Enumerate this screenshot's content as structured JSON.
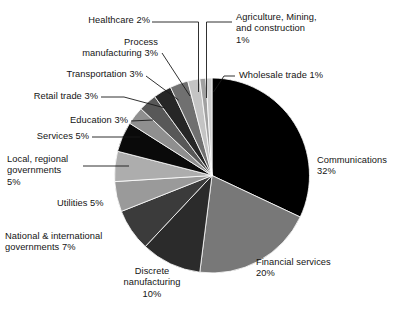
{
  "chart_data": {
    "type": "pie",
    "title": "",
    "subtitle": "",
    "xlabel": "",
    "ylabel": "",
    "legend_position": "callout-labels",
    "grid": false,
    "start_angle_deg": 0,
    "direction": "clockwise",
    "units": "percent",
    "categories": [
      "Communications",
      "Financial services",
      "Discrete nanufacturing",
      "National & international governments",
      "Utilities",
      "Local, regional governments",
      "Services",
      "Education",
      "Retail trade",
      "Transportation",
      "Process manufacturing",
      "Healthcare",
      "Agriculture, Mining, and construction",
      "Wholesale trade"
    ],
    "values": [
      32,
      20,
      10,
      7,
      5,
      5,
      5,
      3,
      3,
      3,
      3,
      2,
      1,
      1
    ],
    "slice_colors": [
      "#000000",
      "#787878",
      "#2b2b2b",
      "#3b3b3b",
      "#9a9a9a",
      "#adadad",
      "#0a0a0a",
      "#8f8f8f",
      "#585858",
      "#262626",
      "#707070",
      "#c4c4c4",
      "#a0a0a0",
      "#cfcfcf"
    ],
    "slices": [
      {
        "label": "Communications",
        "value": 32,
        "display": "Communications\n32%",
        "color": "#000000"
      },
      {
        "label": "Financial services",
        "value": 20,
        "display": "Financial services\n20%",
        "color": "#787878"
      },
      {
        "label": "Discrete nanufacturing",
        "value": 10,
        "display": "Discrete\nnanufacturing\n10%",
        "color": "#2b2b2b"
      },
      {
        "label": "National & international governments",
        "value": 7,
        "display": "National & international\ngovernments 7%",
        "color": "#3b3b3b"
      },
      {
        "label": "Utilities",
        "value": 5,
        "display": "Utilities 5%",
        "color": "#9a9a9a"
      },
      {
        "label": "Local, regional governments",
        "value": 5,
        "display": "Local, regional\ngovernments\n5%",
        "color": "#adadad"
      },
      {
        "label": "Services",
        "value": 5,
        "display": "Services 5%",
        "color": "#0a0a0a"
      },
      {
        "label": "Education",
        "value": 3,
        "display": "Education 3%",
        "color": "#8f8f8f"
      },
      {
        "label": "Retail trade",
        "value": 3,
        "display": "Retail trade 3%",
        "color": "#585858"
      },
      {
        "label": "Transportation",
        "value": 3,
        "display": "Transportation 3%",
        "color": "#262626"
      },
      {
        "label": "Process manufacturing",
        "value": 3,
        "display": "Process\nmanufacturing 3%",
        "color": "#707070"
      },
      {
        "label": "Healthcare",
        "value": 2,
        "display": "Healthcare 2%",
        "color": "#c4c4c4"
      },
      {
        "label": "Agriculture, Mining, and construction",
        "value": 1,
        "display": "Agriculture, Mining,\nand construction\n1%",
        "color": "#a0a0a0"
      },
      {
        "label": "Wholesale trade",
        "value": 1,
        "display": "Wholesale trade 1%",
        "color": "#cfcfcf"
      }
    ]
  },
  "labels": {
    "communications": "Communications\n32%",
    "financial_services": "Financial services\n20%",
    "discrete_manufacturing": "Discrete\nnanufacturing\n10%",
    "national_international": "National & international\ngovernments 7%",
    "utilities": "Utilities 5%",
    "local_regional": "Local, regional\ngovernments\n5%",
    "services": "Services 5%",
    "education": "Education 3%",
    "retail_trade": "Retail trade 3%",
    "transportation": "Transportation 3%",
    "process_manufacturing": "Process\nmanufacturing 3%",
    "healthcare": "Healthcare 2%",
    "agriculture": "Agriculture, Mining,\nand construction\n1%",
    "wholesale_trade": "Wholesale trade 1%"
  },
  "style": {
    "background": "#ffffff",
    "text_color": "#141414",
    "leader_line_color": "#1a1a1a"
  }
}
